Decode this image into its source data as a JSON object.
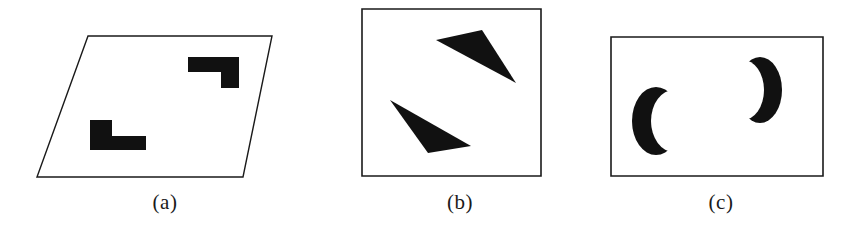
{
  "figure": {
    "width": 852,
    "height": 234,
    "background_color": "#ffffff",
    "stroke_color": "#1a1a1a",
    "fill_color": "#111111",
    "panel_count": 3
  },
  "panels": [
    {
      "id": "a",
      "caption": "(a)",
      "frame_shape": "parallelogram",
      "frame_points": "88,36 272,36 243,177 37,177",
      "figures": [
        {
          "name": "l-shape-lower-left",
          "shape": "polygon",
          "points": "90,120 112,120 112,136 146,136 146,150 90,150",
          "orientation": "upright-L"
        },
        {
          "name": "l-shape-upper-right",
          "shape": "polygon",
          "points": "188,57 239,57 239,88 221,88 221,72 188,72",
          "orientation": "rotated-L"
        }
      ]
    },
    {
      "id": "b",
      "caption": "(b)",
      "frame_shape": "rectangle",
      "frame_points": "32,9 211,9 211,176 32,176",
      "figures": [
        {
          "name": "triangle-upper-right",
          "shape": "polygon",
          "points": "106,40 152,30 186,83",
          "orientation": "thin-triangle-pointing-down-right"
        },
        {
          "name": "triangle-lower-left",
          "shape": "polygon",
          "points": "60,100 141,146 98,153",
          "orientation": "thin-triangle-pointing-up-left"
        }
      ]
    },
    {
      "id": "c",
      "caption": "(c)",
      "frame_shape": "rectangle",
      "frame_points": "21,37 233,37 233,176 21,176",
      "figures": [
        {
          "name": "crescent-left",
          "shape": "crescent",
          "opens": "right",
          "outer_cx": 66,
          "outer_cy": 121,
          "outer_rx": 24,
          "outer_ry": 34,
          "inner_cx": 84,
          "inner_cy": 121,
          "inner_rx": 23,
          "inner_ry": 31
        },
        {
          "name": "crescent-right",
          "shape": "crescent",
          "opens": "left",
          "outer_cx": 170,
          "outer_cy": 90,
          "outer_rx": 22,
          "outer_ry": 33,
          "inner_cx": 153,
          "inner_cy": 90,
          "inner_rx": 21,
          "inner_ry": 30
        }
      ]
    }
  ]
}
